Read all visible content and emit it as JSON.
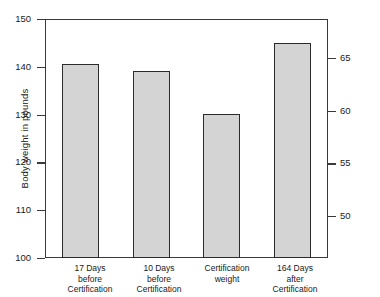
{
  "chart_data": {
    "type": "bar",
    "title": "",
    "subtitle": "",
    "xlabel": "",
    "ylabel": "Body weight in pounds",
    "ylabel_secondary": "Body weight in kilograms",
    "categories": [
      "17 Days\nbefore\nCertification",
      "10 Days\nbefore\nCertification",
      "Certification\nweight",
      "164 Days\nafter\nCertification"
    ],
    "values": [
      140.5,
      139.2,
      130.2,
      145.0
    ],
    "value_unit": "pounds",
    "values_kilograms": [
      63.7,
      63.1,
      59.1,
      65.8
    ],
    "ylim": [
      100,
      150
    ],
    "yticks": [
      100,
      110,
      120,
      130,
      140,
      150
    ],
    "yticklabels": [
      "100",
      "110",
      "120",
      "130",
      "140",
      "150"
    ],
    "ylim_secondary": [
      45.4,
      68.0
    ],
    "yticks_secondary": [
      50,
      55,
      60,
      65
    ],
    "yticklabels_secondary": [
      "50",
      "55",
      "60",
      "65"
    ],
    "grid": false,
    "legend": false,
    "legend_position": "none",
    "bar_fill_color": "#d4d4d4",
    "bar_edge_color": "#2b2b2b",
    "axis_color": "#3a3a3a",
    "background_color": "#ffffff"
  }
}
